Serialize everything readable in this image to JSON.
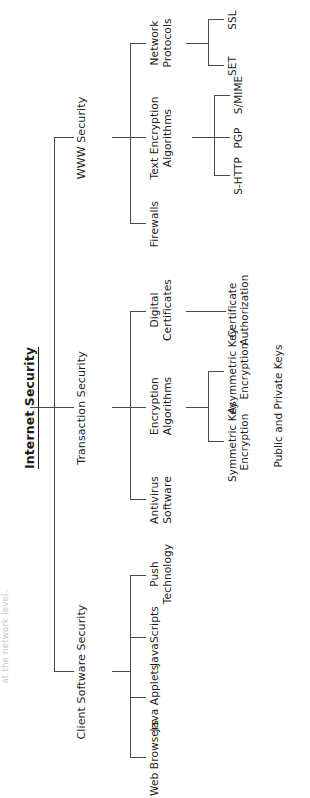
{
  "figure": {
    "title": "Internet Security",
    "type": "hierarchical tree diagram",
    "orientation": "rotated 90 degrees counter-clockwise on the page",
    "margin_note": "at the network level."
  },
  "colors": {
    "text": "#1c1c1c",
    "line": "#4a4a4a",
    "background": "#ffffff",
    "faint_text": "#c9c9c9"
  },
  "tree": {
    "root": "Internet Security",
    "children": [
      {
        "label": "Client Software Security",
        "children": [
          {
            "label": "Web Browsers",
            "children": []
          },
          {
            "label": "Java Applets",
            "children": []
          },
          {
            "label": "JavaScripts",
            "children": []
          },
          {
            "label": "Push Technology",
            "children": []
          }
        ]
      },
      {
        "label": "Transaction Security",
        "children": [
          {
            "label": "Antivirus Software",
            "children": []
          },
          {
            "label": "Encryption Algorithms",
            "children": [
              {
                "label": "Symmetric Key Encryption Public and Private Keys"
              },
              {
                "label": "Asymmetric Key Encryption"
              }
            ]
          },
          {
            "label": "Digital Certificates",
            "children": [
              {
                "label": "Certificate Authorization"
              }
            ]
          }
        ]
      },
      {
        "label": "WWW Security",
        "children": [
          {
            "label": "Firewalls",
            "children": []
          },
          {
            "label": "Text Encryption Algorithms",
            "children": [
              {
                "label": "S-HTTP"
              },
              {
                "label": "PGP"
              },
              {
                "label": "S/MIME"
              }
            ]
          },
          {
            "label": "Network Protocols",
            "children": [
              {
                "label": "SET"
              },
              {
                "label": "SSL"
              }
            ]
          }
        ]
      }
    ]
  },
  "labels": {
    "root": "Internet Security",
    "client_software_security": "Client Software Security",
    "web_browsers": "Web Browsers",
    "java_applets": "Java Applets",
    "javascripts": "JavaScripts",
    "push_technology": "Push Technology",
    "transaction_security": "Transaction Security",
    "antivirus_software": "Antivirus Software",
    "encryption_algorithms": "Encryption Algorithms",
    "symmetric_key": "Symmetric Key Encryption",
    "public_private_keys": "Public and Private Keys",
    "asymmetric_key": "Asymmetric Key Encryption",
    "digital_certificates": "Digital Certificates",
    "certificate_authorization": "Certificate Authorization",
    "www_security": "WWW Security",
    "firewalls": "Firewalls",
    "text_encryption_algorithms": "Text Encryption Algorithms",
    "s_http": "S-HTTP",
    "pgp": "PGP",
    "s_mime": "S/MIME",
    "network_protocols": "Network Protocols",
    "set": "SET",
    "ssl": "SSL",
    "margin_note": "at the network level."
  }
}
